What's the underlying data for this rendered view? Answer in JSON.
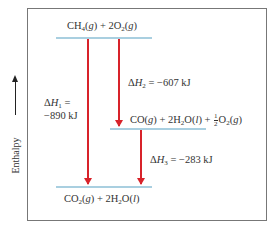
{
  "diagram": {
    "type": "enthalpy-level-diagram",
    "axis_label": "Enthalpy",
    "levels": [
      {
        "id": "top",
        "label": "CH4(g) + 2O2(g)"
      },
      {
        "id": "middle",
        "label": "CO(g) + 2H2O(l) + 1/2 O2(g)"
      },
      {
        "id": "bottom",
        "label": "CO2(g) + 2H2O(l)"
      }
    ],
    "transitions": [
      {
        "from": "top",
        "to": "bottom",
        "label_line1": "ΔH1 =",
        "label_line2": "−890 kJ"
      },
      {
        "from": "top",
        "to": "middle",
        "label": "ΔH2 = −607 kJ"
      },
      {
        "from": "middle",
        "to": "bottom",
        "label": "ΔH3 = −283 kJ"
      }
    ],
    "colors": {
      "level": "#a9cfe0",
      "arrow": "#d8232a",
      "frame": "#777777"
    }
  }
}
